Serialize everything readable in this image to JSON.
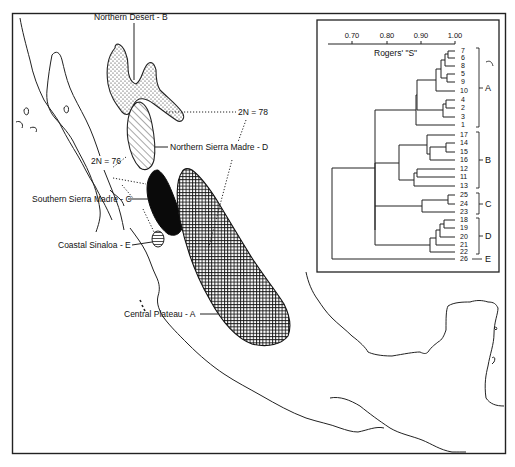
{
  "map": {
    "regions": [
      {
        "id": "B",
        "label": "Northern Desert - B",
        "pattern": "dotted"
      },
      {
        "id": "D",
        "label": "Northern Sierra Madre - D",
        "pattern": "diagonal-hatch"
      },
      {
        "id": "C",
        "label": "Southern Sierra Madre - C",
        "pattern": "solid-black"
      },
      {
        "id": "E",
        "label": "Coastal Sinaloa - E",
        "pattern": "horizontal-hatch"
      },
      {
        "id": "A",
        "label": "Central Plateau - A",
        "pattern": "crosshatch"
      }
    ],
    "annotations": [
      {
        "label": "2N = 78"
      },
      {
        "label": "2N = 76"
      }
    ]
  },
  "dendrogram": {
    "axis_title": "Rogers' \"S\"",
    "ticks": [
      "0.70",
      "0.80",
      "0.90",
      "1.00"
    ],
    "leaves": [
      "7",
      "6",
      "8",
      "5",
      "9",
      "10",
      "4",
      "2",
      "3",
      "1",
      "17",
      "14",
      "15",
      "16",
      "12",
      "11",
      "13",
      "25",
      "24",
      "23",
      "18",
      "19",
      "20",
      "21",
      "22",
      "26"
    ],
    "groups": [
      {
        "label": "A",
        "members": [
          "7",
          "6",
          "8",
          "5",
          "9",
          "10",
          "4",
          "2",
          "3",
          "1"
        ]
      },
      {
        "label": "B",
        "members": [
          "17",
          "14",
          "15",
          "16",
          "12",
          "11",
          "13"
        ]
      },
      {
        "label": "C",
        "members": [
          "25",
          "24",
          "23"
        ]
      },
      {
        "label": "D",
        "members": [
          "18",
          "19",
          "20",
          "21",
          "22"
        ]
      },
      {
        "label": "E",
        "members": [
          "26"
        ]
      }
    ]
  }
}
